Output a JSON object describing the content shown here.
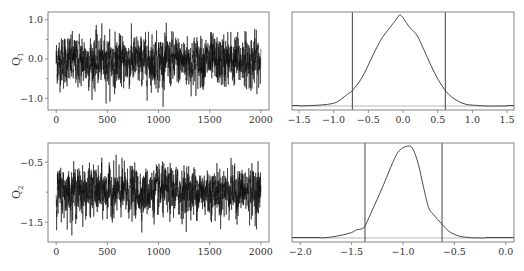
{
  "chart_data": [
    {
      "id": "trace-q1",
      "type": "line",
      "title": "",
      "xlabel": "",
      "ylabel": "Q",
      "ylabel_subscript": "1",
      "xlim": [
        -80,
        2080
      ],
      "ylim": [
        -1.3,
        1.2
      ],
      "xticks": [
        0,
        500,
        1000,
        1500,
        2000
      ],
      "xtick_labels": [
        "0",
        "500",
        "1000",
        "1500",
        "2000"
      ],
      "yticks": [
        -1.0,
        0.0,
        1.0
      ],
      "ytick_labels": [
        "-1.0",
        "0.0",
        "1.0"
      ],
      "yminor_ticks": [
        -0.5,
        0.5
      ],
      "n_iterations": 2000,
      "mean": -0.05,
      "sd": 0.3,
      "max": 1.12,
      "min": -1.22,
      "grid": false
    },
    {
      "id": "density-q1",
      "type": "line",
      "title": "",
      "xlabel": "",
      "ylabel": "",
      "xlim": [
        -1.6,
        1.6
      ],
      "xticks": [
        -1.5,
        -1.0,
        -0.5,
        0.0,
        0.5,
        1.0,
        1.5
      ],
      "xtick_labels": [
        "-1.5",
        "-1.0",
        "-0.5",
        "0.0",
        "0.5",
        "1.0",
        "1.5"
      ],
      "x": [
        -1.5,
        -1.2,
        -1.0,
        -0.9,
        -0.8,
        -0.73,
        -0.6,
        -0.5,
        -0.4,
        -0.3,
        -0.2,
        -0.1,
        -0.05,
        0.0,
        0.1,
        0.2,
        0.3,
        0.4,
        0.5,
        0.61,
        0.7,
        0.8,
        0.9,
        1.0,
        1.2,
        1.5
      ],
      "y": [
        0.0,
        0.01,
        0.03,
        0.07,
        0.13,
        0.17,
        0.3,
        0.45,
        0.61,
        0.75,
        0.85,
        0.95,
        1.0,
        0.97,
        0.86,
        0.78,
        0.62,
        0.45,
        0.3,
        0.17,
        0.1,
        0.05,
        0.02,
        0.01,
        0.0,
        0.0
      ],
      "credible_interval": [
        -0.73,
        0.61
      ],
      "grid": false
    },
    {
      "id": "trace-q2",
      "type": "line",
      "title": "",
      "xlabel": "",
      "ylabel": "Q",
      "ylabel_subscript": "2",
      "xlim": [
        -80,
        2080
      ],
      "ylim": [
        -1.83,
        -0.18
      ],
      "xticks": [
        0,
        500,
        1000,
        1500,
        2000
      ],
      "xtick_labels": [
        "0",
        "500",
        "1000",
        "1500",
        "2000"
      ],
      "yticks": [
        -0.5,
        -1.5
      ],
      "ytick_labels": [
        "-0.5",
        "-1.5"
      ],
      "yminor_ticks": [
        -1.0
      ],
      "n_iterations": 2000,
      "mean": -0.99,
      "sd": 0.19,
      "max": -0.25,
      "min": -1.72,
      "grid": false
    },
    {
      "id": "density-q2",
      "type": "line",
      "title": "",
      "xlabel": "",
      "ylabel": "",
      "xlim": [
        -2.08,
        0.08
      ],
      "xticks": [
        -2.0,
        -1.5,
        -1.0,
        -0.5,
        0.0
      ],
      "xtick_labels": [
        "-2.0",
        "-1.5",
        "-1.0",
        "-0.5",
        "0.0"
      ],
      "x": [
        -1.8,
        -1.7,
        -1.6,
        -1.5,
        -1.45,
        -1.4,
        -1.37,
        -1.3,
        -1.2,
        -1.1,
        -1.05,
        -1.0,
        -0.94,
        -0.9,
        -0.85,
        -0.8,
        -0.75,
        -0.7,
        -0.62,
        -0.55,
        -0.45,
        -0.35,
        -0.2
      ],
      "y": [
        0.0,
        0.01,
        0.03,
        0.06,
        0.09,
        0.1,
        0.13,
        0.3,
        0.55,
        0.82,
        0.93,
        0.98,
        1.0,
        0.96,
        0.8,
        0.55,
        0.33,
        0.25,
        0.15,
        0.07,
        0.02,
        0.005,
        0.0
      ],
      "credible_interval": [
        -1.37,
        -0.62
      ],
      "grid": false
    }
  ],
  "panels": {
    "q1_label": "Q",
    "q1_sub": "1",
    "q2_label": "Q",
    "q2_sub": "2"
  }
}
